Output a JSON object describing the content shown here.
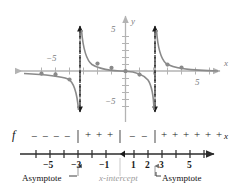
{
  "figure": {
    "type": "math-graph-with-sign-chart",
    "colors": {
      "curve": "#8a8a8a",
      "axis": "#b3b3b3",
      "asymptote": "#1a1a1a",
      "numberline": "#3a3a3a",
      "gray_text": "#9b9b9b",
      "black_text": "#111111"
    }
  },
  "graph": {
    "axis_labels": {
      "x": "x",
      "y": "y"
    },
    "x_ticks": [
      {
        "value": -5,
        "label": "−5"
      },
      {
        "value": 5,
        "label": "5"
      }
    ],
    "y_ticks": [
      {
        "value": 5,
        "label": "5"
      },
      {
        "value": -5,
        "label": "−5"
      }
    ],
    "xlim": [
      -7,
      7
    ],
    "ylim": [
      -7,
      7
    ],
    "asymptotes": [
      -3,
      2
    ],
    "x_intercept": 0,
    "plotted_points": [
      {
        "x": -6,
        "y": -0.4
      },
      {
        "x": -5,
        "y": -0.55
      },
      {
        "x": -4,
        "y": -1.1
      },
      {
        "x": -2,
        "y": 1.1
      },
      {
        "x": -1,
        "y": 0.55
      },
      {
        "x": 0,
        "y": 0
      },
      {
        "x": 1,
        "y": -0.55
      },
      {
        "x": 3,
        "y": 0.9
      },
      {
        "x": 4,
        "y": 0.5
      }
    ]
  },
  "sign_chart": {
    "function_label": "f",
    "axis_label": "x",
    "ticks": [
      {
        "value": -6,
        "label": ""
      },
      {
        "value": -5,
        "label": "−5"
      },
      {
        "value": -4,
        "label": ""
      },
      {
        "value": -3,
        "label": "−3"
      },
      {
        "value": -2,
        "label": ""
      },
      {
        "value": -1,
        "label": "−1"
      },
      {
        "value": 1,
        "label": "1"
      },
      {
        "value": 2,
        "label": "2"
      },
      {
        "value": 3,
        "label": "3"
      },
      {
        "value": 4,
        "label": ""
      },
      {
        "value": 5,
        "label": "5"
      },
      {
        "value": 6,
        "label": ""
      }
    ],
    "dividers": [
      -3,
      0,
      2
    ],
    "signs": [
      {
        "x": -6.1,
        "sign": "−"
      },
      {
        "x": -5.3,
        "sign": "−"
      },
      {
        "x": -4.5,
        "sign": "−"
      },
      {
        "x": -3.7,
        "sign": "−"
      },
      {
        "x": -2.4,
        "sign": "+"
      },
      {
        "x": -1.6,
        "sign": "+"
      },
      {
        "x": -0.8,
        "sign": "+"
      },
      {
        "x": 0.6,
        "sign": "−"
      },
      {
        "x": 1.4,
        "sign": "−"
      },
      {
        "x": 2.6,
        "sign": "+"
      },
      {
        "x": 3.3,
        "sign": "+"
      },
      {
        "x": 4.0,
        "sign": "+"
      },
      {
        "x": 4.7,
        "sign": "+"
      },
      {
        "x": 5.4,
        "sign": "+"
      },
      {
        "x": 6.1,
        "sign": "+"
      }
    ]
  },
  "callouts": {
    "asymptote_left": "Asymptote",
    "x_intercept": "x-intercept",
    "asymptote_right": "Asymptote"
  }
}
